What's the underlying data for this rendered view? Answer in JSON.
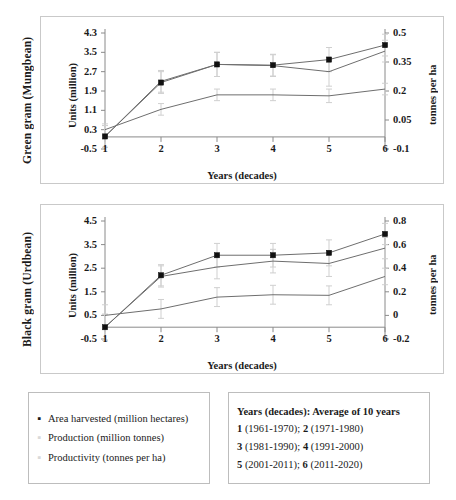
{
  "figure": {
    "panels": [
      {
        "row_title": "Green gram (Mungbean)",
        "ylabel": "Units (million)",
        "xlabel": "Years (decades)",
        "y2label": "tonnes per ha",
        "yticks": [
          "-0.5",
          "0.3",
          "1.1",
          "1.9",
          "2.7",
          "3.5",
          "4.3"
        ],
        "y2ticks": [
          "-0.1",
          "0.05",
          "0.2",
          "0.35",
          "0.5"
        ],
        "xticks": [
          "1",
          "2",
          "3",
          "4",
          "5",
          "6"
        ]
      },
      {
        "row_title": "Black gram (Urdbean)",
        "ylabel": "Units (million)",
        "xlabel": "Years (decades)",
        "y2label": "tonnes per ha",
        "yticks": [
          "-0.5",
          "0.5",
          "1.5",
          "2.5",
          "3.5",
          "4.5"
        ],
        "y2ticks": [
          "-0.2",
          "0",
          "0.2",
          "0.4",
          "0.6",
          "0.8"
        ],
        "xticks": [
          "1",
          "2",
          "3",
          "4",
          "5",
          "6"
        ]
      }
    ]
  },
  "legend": {
    "series": [
      {
        "marker": "▪",
        "tone": "dark",
        "label": "Area harvested (million hectares)"
      },
      {
        "marker": "▪",
        "tone": "faint",
        "label": "Production (million tonnes)"
      },
      {
        "marker": "▪",
        "tone": "faint",
        "label": "Productivity (tonnes per ha)"
      }
    ]
  },
  "years_key": {
    "heading": "Years (decades): Average of 10 years",
    "rows": [
      {
        "n1": "1",
        "r1": "(1961-1970); ",
        "n2": "2",
        "r2": "(1971-1980)"
      },
      {
        "n1": "3",
        "r1": "(1981-1990); ",
        "n2": "4",
        "r2": "(1991-2000)"
      },
      {
        "n1": "5",
        "r1": "(2001-2011); ",
        "n2": "6",
        "r2": "(2011-2020)"
      }
    ]
  },
  "colors": {
    "line": "#6e6e6e",
    "marker": "#111111",
    "errorbar": "#cfcfcf",
    "frame": "#c9c9c9",
    "axis": "#8a8a8a"
  },
  "chart_data": [
    {
      "type": "line",
      "title": "Green gram (Mungbean)",
      "xlabel": "Years (decades)",
      "ylabel": "Units (million)",
      "y2label": "tonnes per ha",
      "grid": false,
      "legend_position": "below-figure",
      "categories": [
        "1",
        "2",
        "3",
        "4",
        "5",
        "6"
      ],
      "ylim": [
        -0.5,
        4.3
      ],
      "y2lim": [
        -0.1,
        0.5
      ],
      "yticks": [
        -0.5,
        0.3,
        1.1,
        1.9,
        2.7,
        3.5,
        4.3
      ],
      "y2ticks": [
        -0.1,
        0.05,
        0.2,
        0.35,
        0.5
      ],
      "series": [
        {
          "name": "Area harvested (million hectares)",
          "axis": "left",
          "values": [
            0.02,
            2.25,
            3.0,
            2.97,
            3.2,
            3.8
          ],
          "errors": [
            0.45,
            0.45,
            0.5,
            0.45,
            0.5,
            0.45
          ]
        },
        {
          "name": "Production (million tonnes)",
          "axis": "left",
          "values": [
            0.02,
            2.3,
            3.0,
            2.95,
            2.7,
            3.55
          ],
          "errors": [
            0.45,
            0.45,
            0.5,
            0.45,
            0.6,
            0.45
          ]
        },
        {
          "name": "Productivity (tonnes per ha)",
          "axis": "right",
          "values": [
            0.0,
            0.105,
            0.18,
            0.18,
            0.175,
            0.21
          ],
          "errors": [
            0.03,
            0.03,
            0.03,
            0.03,
            0.035,
            0.03
          ]
        }
      ]
    },
    {
      "type": "line",
      "title": "Black gram (Urdbean)",
      "xlabel": "Years (decades)",
      "ylabel": "Units (million)",
      "y2label": "tonnes per ha",
      "grid": false,
      "legend_position": "below-figure",
      "categories": [
        "1",
        "2",
        "3",
        "4",
        "5",
        "6"
      ],
      "ylim": [
        -0.5,
        4.5
      ],
      "y2lim": [
        -0.2,
        0.8
      ],
      "yticks": [
        -0.5,
        0.5,
        1.5,
        2.5,
        3.5,
        4.5
      ],
      "y2ticks": [
        -0.2,
        0,
        0.2,
        0.4,
        0.6,
        0.8
      ],
      "series": [
        {
          "name": "Area harvested (million hectares)",
          "axis": "left",
          "values": [
            0.0,
            2.2,
            3.05,
            3.05,
            3.15,
            3.95
          ],
          "errors": [
            0.55,
            0.45,
            0.5,
            0.5,
            0.55,
            0.45
          ]
        },
        {
          "name": "Production (million tonnes)",
          "axis": "left",
          "values": [
            0.0,
            2.15,
            2.55,
            2.8,
            2.7,
            3.35
          ],
          "errors": [
            0.55,
            0.45,
            0.5,
            0.5,
            0.55,
            0.45
          ]
        },
        {
          "name": "Productivity (tonnes per ha)",
          "axis": "right",
          "values": [
            0.0,
            0.055,
            0.155,
            0.175,
            0.17,
            0.33
          ],
          "errors": [
            0.09,
            0.08,
            0.08,
            0.08,
            0.08,
            0.07
          ]
        }
      ]
    }
  ]
}
